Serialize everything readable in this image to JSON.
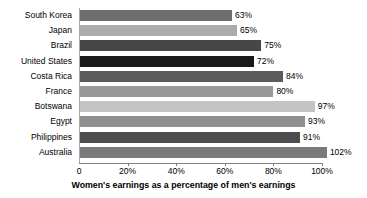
{
  "chart_data": {
    "type": "bar",
    "orientation": "horizontal",
    "title": "",
    "xlabel": "Women's earnings as a percentage of men's earnings",
    "ylabel": "",
    "categories": [
      "South Korea",
      "Japan",
      "Brazil",
      "United States",
      "Costa Rica",
      "France",
      "Botswana",
      "Egypt",
      "Philippines",
      "Australia"
    ],
    "values": [
      63,
      65,
      75,
      72,
      84,
      80,
      97,
      93,
      91,
      102
    ],
    "value_labels": [
      "63%",
      "65%",
      "75%",
      "72%",
      "84%",
      "80%",
      "97%",
      "93%",
      "91%",
      "102%"
    ],
    "bar_colors": [
      "#6e6e6e",
      "#ababab",
      "#474747",
      "#1a1a1a",
      "#5c5c5c",
      "#999999",
      "#c4c4c4",
      "#8f8f8f",
      "#4d4d4d",
      "#7a7a7a"
    ],
    "xlim": [
      0,
      105
    ],
    "xticks": [
      0,
      20,
      40,
      60,
      80,
      100
    ],
    "xtick_labels": [
      "0",
      "20%",
      "40%",
      "60%",
      "80%",
      "100%"
    ],
    "grid": false,
    "legend": "none",
    "background_color": "#ffffff",
    "axis_color": "#808080"
  }
}
